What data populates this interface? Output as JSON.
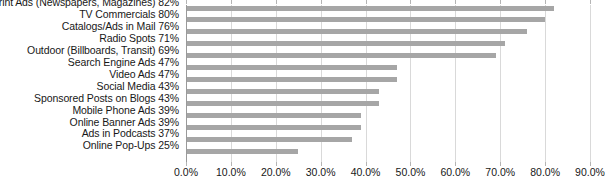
{
  "chart_data": {
    "type": "bar",
    "orientation": "horizontal",
    "title": "",
    "xlabel": "",
    "ylabel": "",
    "xlim": [
      0,
      90
    ],
    "grid": true,
    "legend": false,
    "bar_color": "#a6a6a6",
    "gridline_color": "#d9d9d9",
    "axis_color": "#9a9a9a",
    "xticks": [
      "0.0%",
      "10.0%",
      "20.0%",
      "30.0%",
      "40.0%",
      "50.0%",
      "60.0%",
      "70.0%",
      "80.0%",
      "90.0%"
    ],
    "xtick_values": [
      0,
      10,
      20,
      30,
      40,
      50,
      60,
      70,
      80,
      90
    ],
    "categories": [
      "Print Ads (Newspapers, Magazines)",
      "TV Commercials",
      "Catalogs/Ads in Mail",
      "Radio Spots",
      "Outdoor (Billboards, Transit)",
      "Search Engine Ads",
      "Video Ads",
      "Social Media",
      "Sponsored Posts on Blogs",
      "Mobile Phone Ads",
      "Online Banner Ads",
      "Ads in Podcasts",
      "Online Pop-Ups"
    ],
    "values": [
      82,
      80,
      76,
      71,
      69,
      47,
      47,
      43,
      43,
      39,
      39,
      37,
      25
    ],
    "labels": [
      "Print Ads (Newspapers, Magazines) 82%",
      "TV Commercials 80%",
      "Catalogs/Ads in Mail 76%",
      "Radio Spots 71%",
      "Outdoor (Billboards, Transit) 69%",
      "Search Engine Ads 47%",
      "Video Ads 47%",
      "Social Media 43%",
      "Sponsored Posts on Blogs 43%",
      "Mobile Phone Ads 39%",
      "Online Banner Ads 39%",
      "Ads in Podcasts 37%",
      "Online Pop-Ups 25%"
    ]
  }
}
